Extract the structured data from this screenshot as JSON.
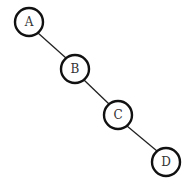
{
  "diagram": {
    "type": "tree",
    "nodes": [
      {
        "id": "A",
        "label": "A",
        "cx": 29,
        "cy": 22,
        "r": 14
      },
      {
        "id": "B",
        "label": "B",
        "cx": 75,
        "cy": 69,
        "r": 14
      },
      {
        "id": "C",
        "label": "C",
        "cx": 118,
        "cy": 115,
        "r": 14
      },
      {
        "id": "D",
        "label": "D",
        "cx": 166,
        "cy": 162,
        "r": 14
      }
    ],
    "edges": [
      {
        "from": "A",
        "to": "B"
      },
      {
        "from": "B",
        "to": "C"
      },
      {
        "from": "C",
        "to": "D"
      }
    ]
  }
}
